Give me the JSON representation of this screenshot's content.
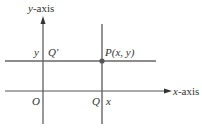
{
  "diagram": {
    "type": "coordinate-plane",
    "labels": {
      "y_axis": "y-axis",
      "x_axis": "x-axis",
      "origin": "O",
      "point_p": "P(x, y)",
      "point_q": "Q",
      "point_q_prime": "Q′",
      "y_coord": "y",
      "x_coord": "x"
    },
    "colors": {
      "line": "#555555",
      "point": "#555555",
      "text": "#333333"
    }
  }
}
